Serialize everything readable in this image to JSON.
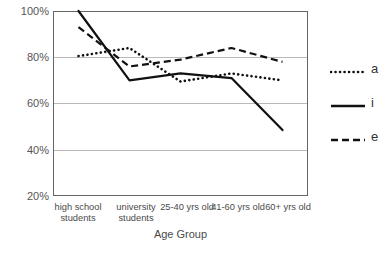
{
  "chart_data": {
    "type": "line",
    "title": "",
    "xlabel": "Age Group",
    "ylabel": "",
    "categories": [
      "high school students",
      "university students",
      "25-40 yrs old",
      "41-60 yrs old",
      "60+ yrs old"
    ],
    "category_lines": [
      [
        "high school",
        "students"
      ],
      [
        "university",
        "students"
      ],
      [
        "25-40 yrs old",
        ""
      ],
      [
        "41-60 yrs old",
        ""
      ],
      [
        "60+ yrs old",
        ""
      ]
    ],
    "series": [
      {
        "name": "a",
        "style": "dotted",
        "values": [
          80.5,
          84.0,
          69.5,
          73.0,
          70.0
        ]
      },
      {
        "name": "i",
        "style": "solid",
        "values": [
          100.0,
          70.0,
          73.0,
          71.0,
          48.5
        ]
      },
      {
        "name": "e",
        "style": "dashed",
        "values": [
          93.0,
          76.0,
          79.0,
          84.0,
          78.0
        ]
      }
    ],
    "ylim": [
      20,
      100
    ],
    "yticks": [
      100,
      80,
      60,
      40,
      20
    ],
    "ytick_labels": [
      "100%",
      "80%",
      "60%",
      "40%",
      "20%"
    ],
    "grid": true,
    "grid_axis": "y",
    "legend_position": "right",
    "line_color": "#1a1a1a",
    "grid_color": "#b9b9b9",
    "frame_color": "#666666"
  },
  "axis": {
    "y_labels": [
      "100%",
      "80%",
      "60%",
      "40%",
      "20%"
    ],
    "x_title": "Age Group"
  },
  "legend": {
    "entries": [
      {
        "label": "a",
        "style": "dotted"
      },
      {
        "label": "i",
        "style": "solid"
      },
      {
        "label": "e",
        "style": "dashed"
      }
    ]
  }
}
